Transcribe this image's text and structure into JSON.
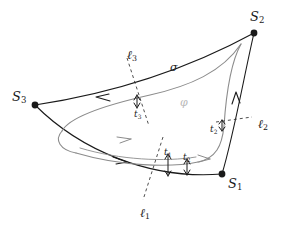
{
  "figure": {
    "type": "mathematical-diagram",
    "background_color": "#ffffff",
    "stroke_color": "#1a1a1a",
    "inner_curve_color": "#8c8c8c",
    "faint_label_color": "#b9b9b9"
  },
  "vertices": [
    {
      "id": "S1",
      "base": "S",
      "sub": "1",
      "x": 222,
      "y": 174,
      "label_x": 228,
      "label_y": 177
    },
    {
      "id": "S2",
      "base": "S",
      "sub": "2",
      "x": 254,
      "y": 33,
      "label_x": 250,
      "label_y": 10
    },
    {
      "id": "S3",
      "base": "S",
      "sub": "3",
      "x": 35,
      "y": 105,
      "label_x": 12,
      "label_y": 90
    }
  ],
  "transversals": [
    {
      "id": "l1",
      "base": "ℓ",
      "sub": "1",
      "label_x": 140,
      "label_y": 207
    },
    {
      "id": "l2",
      "base": "ℓ",
      "sub": "2",
      "label_x": 258,
      "label_y": 118
    },
    {
      "id": "l3",
      "base": "ℓ",
      "sub": "3",
      "label_x": 127,
      "label_y": 49
    }
  ],
  "gaps": [
    {
      "id": "t1",
      "base": "t",
      "sub": "1",
      "label_x": 164,
      "label_y": 148
    },
    {
      "id": "t2_inner",
      "base": "t",
      "sub": "2",
      "label_x": 183,
      "label_y": 153
    },
    {
      "id": "t2",
      "base": "t",
      "sub": "2",
      "label_x": 210,
      "label_y": 125
    },
    {
      "id": "t3",
      "base": "t",
      "sub": "3",
      "label_x": 134,
      "label_y": 110
    }
  ],
  "curve_labels": [
    {
      "id": "sigma",
      "text": "σ",
      "x": 170,
      "y": 62,
      "faint": false
    },
    {
      "id": "phi",
      "text": "φ",
      "x": 180,
      "y": 97,
      "faint": true
    }
  ]
}
